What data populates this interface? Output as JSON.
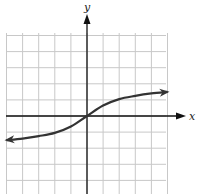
{
  "chart_data": {
    "type": "line",
    "title": "",
    "xlabel": "x",
    "ylabel": "y",
    "xlim": [
      -5,
      5
    ],
    "ylim": [
      -5,
      5
    ],
    "grid": true,
    "grid_step": 1,
    "series": [
      {
        "name": "curve",
        "x": [
          -5,
          -4,
          -3,
          -2,
          -1,
          0,
          1,
          2,
          3,
          4,
          5
        ],
        "y": [
          -1.5,
          -1.4,
          -1.25,
          -1.05,
          -0.65,
          0,
          0.65,
          1.05,
          1.25,
          1.4,
          1.5
        ],
        "arrows": "both"
      }
    ]
  },
  "labels": {
    "x_axis": "x",
    "y_axis": "y"
  },
  "colors": {
    "grid": "#c8c8c8",
    "axis": "#111111",
    "curve": "#333333"
  }
}
